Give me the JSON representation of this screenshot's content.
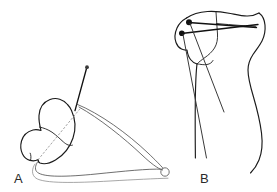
{
  "figure": {
    "background_color": "#ffffff",
    "ink_color": "#1a1a1a",
    "faint_ink_color": "#8a8a8a",
    "panels": [
      {
        "id": "panel-a",
        "label": "A",
        "label_x": 14,
        "label_y": 183,
        "description": "Lateral oblique view of bone fragment with guide pin and retractor outlines",
        "elements": [
          "bone-fragment-outline",
          "fracture-line",
          "dashed-trajectory",
          "guide-pin",
          "retractor-upper-arm",
          "retractor-lower-arm",
          "baseline-curve",
          "ring-marker"
        ]
      },
      {
        "id": "panel-b",
        "label": "B",
        "label_x": 200,
        "label_y": 183,
        "description": "Anteroposterior view of proximal bone with two crossed fixation pins",
        "elements": [
          "bone-outline",
          "condyle-contour",
          "pin-one",
          "pin-two",
          "pin-one-trajectory",
          "pin-two-trajectory",
          "cortical-line"
        ]
      }
    ],
    "markers": {
      "ring_marker_label": "ring-marker",
      "ring_marker_cx": 165,
      "ring_marker_cy": 172,
      "ring_marker_r": 4.2
    }
  }
}
